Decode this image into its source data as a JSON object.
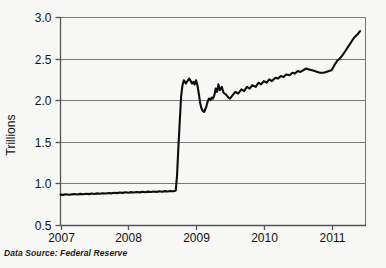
{
  "figure": {
    "source_note": "Data Source: Federal Reserve",
    "background_color": "#f7f7f5",
    "line_color": "#0d0d0d",
    "grid_color": "#7a7a7a",
    "axis_color": "#555555"
  },
  "chart_data": {
    "type": "line",
    "title": "",
    "subtitle": "",
    "xlabel": "",
    "ylabel": "Trillions",
    "ylim": [
      0.5,
      3.0
    ],
    "xlim": [
      2007.0,
      2011.5
    ],
    "yticks": [
      "0.5",
      "1.0",
      "1.5",
      "2.0",
      "2.5",
      "3.0"
    ],
    "ytick_values": [
      0.5,
      1.0,
      1.5,
      2.0,
      2.5,
      3.0
    ],
    "xticks": [
      "2007",
      "2008",
      "2009",
      "2010",
      "2011"
    ],
    "xtick_values": [
      2007,
      2008,
      2009,
      2010,
      2011
    ],
    "grid": "horizontal",
    "legend": "none",
    "legend_position": "none",
    "annotations": [],
    "series": [
      {
        "name": "Federal Reserve Balance Sheet",
        "x": [
          2007.0,
          2007.04,
          2007.08,
          2007.12,
          2007.17,
          2007.21,
          2007.25,
          2007.29,
          2007.33,
          2007.38,
          2007.42,
          2007.46,
          2007.5,
          2007.54,
          2007.58,
          2007.62,
          2007.67,
          2007.71,
          2007.75,
          2007.79,
          2007.83,
          2007.88,
          2007.92,
          2007.96,
          2008.0,
          2008.04,
          2008.08,
          2008.12,
          2008.17,
          2008.21,
          2008.25,
          2008.29,
          2008.33,
          2008.38,
          2008.42,
          2008.46,
          2008.5,
          2008.54,
          2008.58,
          2008.62,
          2008.66,
          2008.7,
          2008.72,
          2008.74,
          2008.76,
          2008.78,
          2008.8,
          2008.82,
          2008.85,
          2008.88,
          2008.9,
          2008.92,
          2008.94,
          2008.96,
          2008.98,
          2009.0,
          2009.02,
          2009.04,
          2009.06,
          2009.08,
          2009.1,
          2009.12,
          2009.15,
          2009.17,
          2009.19,
          2009.21,
          2009.23,
          2009.25,
          2009.27,
          2009.29,
          2009.31,
          2009.33,
          2009.35,
          2009.38,
          2009.4,
          2009.42,
          2009.44,
          2009.46,
          2009.48,
          2009.5,
          2009.54,
          2009.58,
          2009.62,
          2009.67,
          2009.71,
          2009.75,
          2009.79,
          2009.83,
          2009.88,
          2009.92,
          2009.96,
          2010.0,
          2010.04,
          2010.08,
          2010.12,
          2010.17,
          2010.21,
          2010.25,
          2010.29,
          2010.33,
          2010.38,
          2010.42,
          2010.46,
          2010.5,
          2010.54,
          2010.58,
          2010.62,
          2010.67,
          2010.71,
          2010.75,
          2010.79,
          2010.83,
          2010.88,
          2010.92,
          2010.96,
          2011.0,
          2011.04,
          2011.08,
          2011.12,
          2011.17,
          2011.21,
          2011.25,
          2011.29,
          2011.33,
          2011.38,
          2011.42
        ],
        "y": [
          0.865,
          0.862,
          0.87,
          0.864,
          0.868,
          0.872,
          0.866,
          0.874,
          0.869,
          0.876,
          0.871,
          0.878,
          0.873,
          0.88,
          0.875,
          0.882,
          0.878,
          0.885,
          0.88,
          0.888,
          0.883,
          0.89,
          0.886,
          0.893,
          0.888,
          0.895,
          0.89,
          0.897,
          0.892,
          0.899,
          0.894,
          0.901,
          0.896,
          0.903,
          0.898,
          0.905,
          0.9,
          0.907,
          0.902,
          0.909,
          0.905,
          0.912,
          1.1,
          1.45,
          1.75,
          2.05,
          2.18,
          2.24,
          2.2,
          2.24,
          2.26,
          2.23,
          2.2,
          2.22,
          2.19,
          2.24,
          2.18,
          2.08,
          1.97,
          1.9,
          1.87,
          1.86,
          1.92,
          1.98,
          2.02,
          2.0,
          2.03,
          2.02,
          2.06,
          2.14,
          2.1,
          2.19,
          2.12,
          2.16,
          2.1,
          2.08,
          2.07,
          2.05,
          2.03,
          2.02,
          2.06,
          2.1,
          2.08,
          2.13,
          2.11,
          2.16,
          2.14,
          2.18,
          2.16,
          2.21,
          2.19,
          2.23,
          2.21,
          2.25,
          2.23,
          2.27,
          2.26,
          2.29,
          2.28,
          2.31,
          2.3,
          2.33,
          2.32,
          2.35,
          2.34,
          2.36,
          2.38,
          2.37,
          2.36,
          2.35,
          2.34,
          2.33,
          2.33,
          2.34,
          2.35,
          2.36,
          2.42,
          2.47,
          2.5,
          2.55,
          2.6,
          2.65,
          2.7,
          2.75,
          2.79,
          2.83
        ]
      }
    ]
  }
}
